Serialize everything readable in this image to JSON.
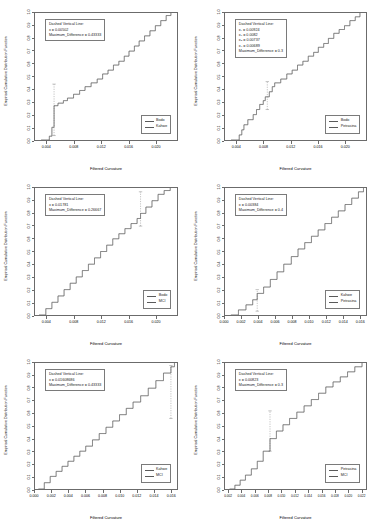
{
  "figure": {
    "layout": "2 columns x 3 rows of ECDF comparison panels",
    "axis_labels": {
      "y": "Empirical Cumulative Distribution Function",
      "x": "Filtered Curvature"
    },
    "y_ticks": [
      "0.0",
      "0.1",
      "0.2",
      "0.3",
      "0.4",
      "0.5",
      "0.6",
      "0.7",
      "0.8",
      "0.9",
      "1.0"
    ],
    "annotation_title": "Dashed Vertical Line:",
    "colors": {
      "curve": "#5a5a5a",
      "frame": "#6b6b6b",
      "dashed": "#6b6b6b",
      "background": "#ffffff"
    }
  },
  "chart_data": [
    {
      "type": "line",
      "panel": 1,
      "title": "",
      "xlabel": "Filtered Curvature",
      "ylabel": "Empirical Cumulative Distribution Function",
      "xlim": [
        0.0022,
        0.0232
      ],
      "ylim": [
        0.0,
        1.0
      ],
      "xticks": [
        0.004,
        0.008,
        0.012,
        0.016,
        0.02
      ],
      "xtick_labels": [
        "0.004",
        "0.008",
        "0.012",
        "0.016",
        "0.020"
      ],
      "grid": false,
      "legend_position": "bottom-right",
      "legend": [
        "Bodo",
        "Kahwe"
      ],
      "annotation": {
        "title": "Dashed Vertical Line:",
        "x_label": "x = 0.00502",
        "x_value": 0.00502,
        "diff_label": "Maximum_Difference = 0.43333",
        "diff_value": 0.43333
      },
      "series": [
        {
          "name": "Bodo",
          "x": [
            0.0031,
            0.00432,
            0.0047,
            0.00502,
            0.0056,
            0.0064,
            0.007,
            0.0079,
            0.0088,
            0.0096,
            0.0105,
            0.0114,
            0.0122,
            0.013,
            0.0138,
            0.0146,
            0.0154,
            0.0161,
            0.0169,
            0.0176,
            0.0184,
            0.0192,
            0.02,
            0.0208,
            0.0216,
            0.0223
          ],
          "y": [
            0.0,
            0.03,
            0.1,
            0.27,
            0.29,
            0.31,
            0.33,
            0.36,
            0.39,
            0.42,
            0.45,
            0.48,
            0.52,
            0.55,
            0.59,
            0.62,
            0.66,
            0.7,
            0.74,
            0.78,
            0.82,
            0.86,
            0.9,
            0.94,
            0.98,
            1.0
          ]
        },
        {
          "name": "Kahwe",
          "x": [
            0.0031,
            0.00432,
            0.0047,
            0.00502,
            0.0056,
            0.0064,
            0.007,
            0.0079,
            0.0088,
            0.0096,
            0.0105,
            0.0114,
            0.0122,
            0.013,
            0.0138,
            0.0146,
            0.0154,
            0.0161,
            0.0169,
            0.0176,
            0.0184,
            0.0192,
            0.02,
            0.0208,
            0.0216,
            0.0223
          ],
          "y": [
            0.0,
            0.03,
            0.1,
            0.27,
            0.29,
            0.31,
            0.33,
            0.36,
            0.39,
            0.42,
            0.45,
            0.48,
            0.52,
            0.55,
            0.59,
            0.62,
            0.66,
            0.7,
            0.74,
            0.78,
            0.82,
            0.86,
            0.9,
            0.94,
            0.98,
            1.0
          ]
        }
      ],
      "dashed_marker": {
        "x": 0.00502,
        "y_low": 0.035,
        "y_high": 0.44
      }
    },
    {
      "type": "line",
      "panel": 2,
      "title": "",
      "xlabel": "Filtered Curvature",
      "ylabel": "Empirical Cumulative Distribution Function",
      "xlim": [
        0.0022,
        0.0232
      ],
      "ylim": [
        0.0,
        1.0
      ],
      "xticks": [
        0.004,
        0.008,
        0.012,
        0.016,
        0.02
      ],
      "xtick_labels": [
        "0.004",
        "0.008",
        "0.012",
        "0.016",
        "0.020"
      ],
      "grid": false,
      "legend_position": "bottom-right",
      "legend": [
        "Bodo",
        "Petrasina"
      ],
      "annotation": {
        "title": "Dashed Vertical Line:",
        "lines": [
          {
            "sub": "1",
            "text": "x₁ = 0.00924",
            "value": 0.00924
          },
          {
            "sub": "2",
            "text": "x₂ = 0.0082",
            "value": 0.0082
          },
          {
            "sub": "3",
            "text": "x₃ = 0.00737",
            "value": 0.00737
          },
          {
            "sub": "4",
            "text": "x₄ = 0.00689",
            "value": 0.00689
          }
        ],
        "diff_label": "Maximum_Difference = 0.3",
        "diff_value": 0.3
      },
      "series": [
        {
          "name": "Bodo",
          "x": [
            0.0031,
            0.00432,
            0.0047,
            0.00502,
            0.0056,
            0.0064,
            0.00689,
            0.00737,
            0.0079,
            0.0082,
            0.0088,
            0.00924,
            0.0096,
            0.0105,
            0.0114,
            0.0122,
            0.013,
            0.0138,
            0.0146,
            0.0154,
            0.0161,
            0.0169,
            0.0176,
            0.0184,
            0.0192,
            0.02,
            0.0208,
            0.0216,
            0.0223
          ],
          "y": [
            0.0,
            0.04,
            0.08,
            0.12,
            0.16,
            0.2,
            0.24,
            0.28,
            0.31,
            0.34,
            0.38,
            0.42,
            0.45,
            0.48,
            0.52,
            0.55,
            0.59,
            0.62,
            0.66,
            0.69,
            0.73,
            0.76,
            0.8,
            0.84,
            0.87,
            0.9,
            0.94,
            0.97,
            1.0
          ]
        },
        {
          "name": "Petrasina",
          "x": [
            0.0031,
            0.00432,
            0.0047,
            0.00502,
            0.0056,
            0.0064,
            0.00689,
            0.00737,
            0.0079,
            0.0082,
            0.0088,
            0.00924,
            0.0096,
            0.0105,
            0.0114,
            0.0122,
            0.013,
            0.0138,
            0.0146,
            0.0154,
            0.0161,
            0.0169,
            0.0176,
            0.0184,
            0.0192,
            0.02,
            0.0208,
            0.0216,
            0.0223
          ],
          "y": [
            0.0,
            0.04,
            0.08,
            0.12,
            0.16,
            0.2,
            0.24,
            0.28,
            0.31,
            0.34,
            0.38,
            0.42,
            0.45,
            0.48,
            0.52,
            0.55,
            0.59,
            0.62,
            0.66,
            0.69,
            0.73,
            0.76,
            0.8,
            0.84,
            0.87,
            0.9,
            0.94,
            0.97,
            1.0
          ]
        }
      ],
      "dashed_marker": {
        "x": 0.0085,
        "y_low": 0.24,
        "y_high": 0.46
      }
    },
    {
      "type": "line",
      "panel": 3,
      "title": "",
      "xlabel": "Filtered Curvature",
      "ylabel": "Empirical Cumulative Distribution Function",
      "xlim": [
        0.0022,
        0.0232
      ],
      "ylim": [
        0.0,
        1.0
      ],
      "xticks": [
        0.004,
        0.008,
        0.012,
        0.016,
        0.02
      ],
      "xtick_labels": [
        "0.004",
        "0.008",
        "0.012",
        "0.016",
        "0.020"
      ],
      "grid": false,
      "legend_position": "bottom-right",
      "legend": [
        "Bodo",
        "MCI"
      ],
      "annotation": {
        "title": "Dashed Vertical Line:",
        "x_label": "x = 0.01781",
        "x_value": 0.01781,
        "diff_label": "Maximum_Difference = 0.26667",
        "diff_value": 0.26667
      },
      "series": [
        {
          "name": "Bodo",
          "x": [
            0.0028,
            0.0038,
            0.0047,
            0.0056,
            0.0065,
            0.0074,
            0.0083,
            0.0092,
            0.0101,
            0.011,
            0.0119,
            0.0128,
            0.0137,
            0.0146,
            0.0155,
            0.0164,
            0.0173,
            0.01781,
            0.0186,
            0.0195,
            0.0204,
            0.0213,
            0.0222
          ],
          "y": [
            0.0,
            0.05,
            0.1,
            0.15,
            0.2,
            0.25,
            0.3,
            0.35,
            0.4,
            0.45,
            0.5,
            0.55,
            0.6,
            0.64,
            0.68,
            0.72,
            0.76,
            0.8,
            0.85,
            0.9,
            0.95,
            0.98,
            1.0
          ]
        },
        {
          "name": "MCI",
          "x": [
            0.0028,
            0.0038,
            0.0047,
            0.0056,
            0.0065,
            0.0074,
            0.0083,
            0.0092,
            0.0101,
            0.011,
            0.0119,
            0.0128,
            0.0137,
            0.0146,
            0.0155,
            0.0164,
            0.0173,
            0.01781,
            0.0186,
            0.0195,
            0.0204,
            0.0213,
            0.0222
          ],
          "y": [
            0.0,
            0.05,
            0.1,
            0.15,
            0.2,
            0.25,
            0.3,
            0.35,
            0.4,
            0.45,
            0.5,
            0.55,
            0.6,
            0.64,
            0.68,
            0.72,
            0.76,
            0.8,
            0.85,
            0.9,
            0.95,
            0.98,
            1.0
          ]
        }
      ],
      "dashed_marker": {
        "x": 0.01781,
        "y_low": 0.7,
        "y_high": 0.97
      }
    },
    {
      "type": "line",
      "panel": 4,
      "title": "",
      "xlabel": "Filtered Curvature",
      "ylabel": "Empirical Cumulative Distribution Function",
      "xlim": [
        0.0,
        0.0168
      ],
      "ylim": [
        0.0,
        1.0
      ],
      "xticks": [
        0.0,
        0.002,
        0.004,
        0.006,
        0.008,
        0.01,
        0.012,
        0.014,
        0.016
      ],
      "xtick_labels": [
        "0.000",
        "0.002",
        "0.004",
        "0.006",
        "0.008",
        "0.010",
        "0.012",
        "0.014",
        "0.016"
      ],
      "grid": false,
      "legend_position": "bottom-right",
      "legend": [
        "Kahwe",
        "Petrasina"
      ],
      "annotation": {
        "title": "Dashed Vertical Line:",
        "x_label": "x = 0.00384",
        "x_value": 0.00384,
        "diff_label": "Maximum_Difference = 0.4",
        "diff_value": 0.4
      },
      "series": [
        {
          "name": "Kahwe",
          "x": [
            0.0007,
            0.0016,
            0.0025,
            0.0033,
            0.00384,
            0.0046,
            0.0054,
            0.0062,
            0.007,
            0.0079,
            0.0087,
            0.0095,
            0.0103,
            0.0111,
            0.0119,
            0.0127,
            0.0135,
            0.0143,
            0.0151,
            0.0159,
            0.0165
          ],
          "y": [
            0.0,
            0.04,
            0.08,
            0.12,
            0.17,
            0.22,
            0.28,
            0.34,
            0.4,
            0.46,
            0.52,
            0.57,
            0.62,
            0.67,
            0.72,
            0.77,
            0.82,
            0.87,
            0.92,
            0.97,
            1.0
          ]
        },
        {
          "name": "Petrasina",
          "x": [
            0.0007,
            0.0016,
            0.0025,
            0.0033,
            0.00384,
            0.0046,
            0.0054,
            0.0062,
            0.007,
            0.0079,
            0.0087,
            0.0095,
            0.0103,
            0.0111,
            0.0119,
            0.0127,
            0.0135,
            0.0143,
            0.0151,
            0.0159,
            0.0165
          ],
          "y": [
            0.0,
            0.04,
            0.08,
            0.12,
            0.17,
            0.22,
            0.28,
            0.34,
            0.4,
            0.46,
            0.52,
            0.57,
            0.62,
            0.67,
            0.72,
            0.77,
            0.82,
            0.87,
            0.92,
            0.97,
            1.0
          ]
        }
      ],
      "dashed_marker": {
        "x": 0.00384,
        "y_low": 0.03,
        "y_high": 0.2
      }
    },
    {
      "type": "line",
      "panel": 5,
      "title": "",
      "xlabel": "Filtered Curvature",
      "ylabel": "Empirical Cumulative Distribution Function",
      "xlim": [
        0.0,
        0.0168
      ],
      "ylim": [
        0.0,
        1.0
      ],
      "xticks": [
        0.0,
        0.002,
        0.004,
        0.006,
        0.008,
        0.01,
        0.012,
        0.014,
        0.016
      ],
      "xtick_labels": [
        "0.000",
        "0.002",
        "0.004",
        "0.006",
        "0.008",
        "0.010",
        "0.012",
        "0.014",
        "0.016"
      ],
      "grid": false,
      "legend_position": "bottom-right",
      "legend": [
        "Kahwe",
        "MCI"
      ],
      "annotation": {
        "title": "Dashed Vertical Line:",
        "x_label": "x = 0.01608686",
        "x_value": 0.01608686,
        "diff_label": "Maximum_Difference = 0.43333",
        "diff_value": 0.43333
      },
      "series": [
        {
          "name": "Kahwe",
          "x": [
            0.0004,
            0.0011,
            0.0018,
            0.0025,
            0.0032,
            0.0039,
            0.0046,
            0.0053,
            0.006,
            0.0068,
            0.0076,
            0.0084,
            0.0092,
            0.01,
            0.0108,
            0.0116,
            0.0125,
            0.0134,
            0.0143,
            0.0152,
            0.01608,
            0.0165
          ],
          "y": [
            0.0,
            0.05,
            0.1,
            0.14,
            0.18,
            0.22,
            0.26,
            0.3,
            0.34,
            0.39,
            0.44,
            0.49,
            0.54,
            0.59,
            0.64,
            0.69,
            0.74,
            0.8,
            0.86,
            0.92,
            0.97,
            1.0
          ]
        },
        {
          "name": "MCI",
          "x": [
            0.0004,
            0.0011,
            0.0018,
            0.0025,
            0.0032,
            0.0039,
            0.0046,
            0.0053,
            0.006,
            0.0068,
            0.0076,
            0.0084,
            0.0092,
            0.01,
            0.0108,
            0.0116,
            0.0125,
            0.0134,
            0.0143,
            0.0152,
            0.01608,
            0.0165
          ],
          "y": [
            0.0,
            0.05,
            0.1,
            0.14,
            0.18,
            0.22,
            0.26,
            0.3,
            0.34,
            0.39,
            0.44,
            0.49,
            0.54,
            0.59,
            0.64,
            0.69,
            0.74,
            0.8,
            0.86,
            0.92,
            0.97,
            1.0
          ]
        }
      ],
      "dashed_marker": {
        "x": 0.01608,
        "y_low": 0.56,
        "y_high": 0.98
      }
    },
    {
      "type": "line",
      "panel": 6,
      "title": "",
      "xlabel": "Filtered Curvature",
      "ylabel": "Empirical Cumulative Distribution Function",
      "xlim": [
        0.0014,
        0.0228
      ],
      "ylim": [
        0.0,
        1.0
      ],
      "xticks": [
        0.002,
        0.004,
        0.006,
        0.008,
        0.01,
        0.012,
        0.014,
        0.016,
        0.018,
        0.02,
        0.022
      ],
      "xtick_labels": [
        "0.002",
        "0.004",
        "0.006",
        "0.008",
        "0.010",
        "0.012",
        "0.014",
        "0.016",
        "0.018",
        "0.020",
        "0.022"
      ],
      "grid": false,
      "legend_position": "bottom-right",
      "legend": [
        "Petrasina",
        "MCI"
      ],
      "annotation": {
        "title": "Dashed Vertical Line:",
        "x_label": "x = 0.00823",
        "x_value": 0.00823,
        "diff_label": "Maximum_Difference = 0.3",
        "diff_value": 0.3
      },
      "series": [
        {
          "name": "Petrasina",
          "x": [
            0.0021,
            0.0029,
            0.0037,
            0.0045,
            0.0054,
            0.0063,
            0.0072,
            0.00823,
            0.0092,
            0.0102,
            0.0112,
            0.0123,
            0.0134,
            0.0145,
            0.0156,
            0.0167,
            0.0178,
            0.0189,
            0.02,
            0.0211,
            0.0222
          ],
          "y": [
            0.0,
            0.03,
            0.07,
            0.11,
            0.16,
            0.22,
            0.3,
            0.4,
            0.46,
            0.51,
            0.56,
            0.61,
            0.66,
            0.71,
            0.76,
            0.81,
            0.85,
            0.89,
            0.93,
            0.97,
            1.0
          ]
        },
        {
          "name": "MCI",
          "x": [
            0.0021,
            0.0029,
            0.0037,
            0.0045,
            0.0054,
            0.0063,
            0.0072,
            0.00823,
            0.0092,
            0.0102,
            0.0112,
            0.0123,
            0.0134,
            0.0145,
            0.0156,
            0.0167,
            0.0178,
            0.0189,
            0.02,
            0.0211,
            0.0222
          ],
          "y": [
            0.0,
            0.03,
            0.07,
            0.11,
            0.16,
            0.22,
            0.3,
            0.4,
            0.46,
            0.51,
            0.56,
            0.61,
            0.66,
            0.71,
            0.76,
            0.81,
            0.85,
            0.89,
            0.93,
            0.97,
            1.0
          ]
        }
      ],
      "dashed_marker": {
        "x": 0.00823,
        "y_low": 0.3,
        "y_high": 0.62
      }
    }
  ]
}
